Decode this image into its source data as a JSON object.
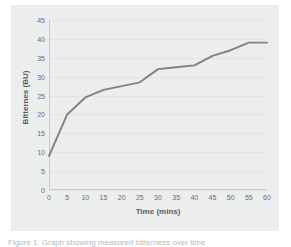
{
  "figure": {
    "caption": "Figure 1: Graph showing measured bitterness over time"
  },
  "chart_data": {
    "type": "line",
    "title": "",
    "xlabel": "Time (mins)",
    "ylabel": "Bitternes (BU)",
    "x": [
      0,
      5,
      10,
      15,
      20,
      25,
      30,
      35,
      40,
      45,
      50,
      55,
      60
    ],
    "values": [
      9,
      20,
      24.5,
      26.5,
      27.5,
      28.5,
      32,
      32.5,
      33,
      35.5,
      37,
      39,
      39
    ],
    "series": [
      {
        "name": "Bitterness",
        "values": [
          9,
          20,
          24.5,
          26.5,
          27.5,
          28.5,
          32,
          32.5,
          33,
          35.5,
          37,
          39,
          39
        ],
        "color": "#808284"
      }
    ],
    "xticks": [
      "0",
      "5",
      "10",
      "15",
      "20",
      "25",
      "30",
      "35",
      "40",
      "45",
      "50",
      "55",
      "60"
    ],
    "yticks": [
      "0",
      "5",
      "10",
      "15",
      "20",
      "25",
      "30",
      "35",
      "40",
      "45"
    ],
    "xlim": [
      0,
      60
    ],
    "ylim": [
      0,
      45
    ],
    "grid": "horizontal",
    "legend": "none",
    "plot_background": "#eceded",
    "gridline_color": "#e2e3e3",
    "tick_label_color": "#6c6d6e",
    "axis_title_color": "#5b5c5d"
  }
}
